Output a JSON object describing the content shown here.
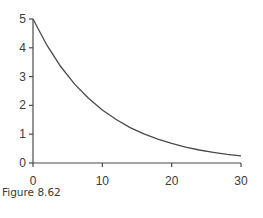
{
  "caption": "Figure 8.62",
  "chart_data": {
    "type": "line",
    "title": "",
    "xlabel": "",
    "ylabel": "",
    "xlim": [
      0,
      30
    ],
    "ylim": [
      0,
      5
    ],
    "xticks": [
      0,
      10,
      20,
      30
    ],
    "yticks": [
      0,
      1,
      2,
      3,
      4,
      5
    ],
    "grid": false,
    "legend": null,
    "series": [
      {
        "name": "curve",
        "x": [
          0,
          2,
          4,
          6,
          8,
          10,
          12,
          14,
          16,
          18,
          20,
          22,
          24,
          26,
          28,
          30
        ],
        "y": [
          5.0,
          4.09,
          3.35,
          2.74,
          2.25,
          1.84,
          1.51,
          1.23,
          1.01,
          0.83,
          0.68,
          0.55,
          0.45,
          0.37,
          0.3,
          0.25
        ]
      }
    ],
    "colors": {
      "line": "#4a4a4a",
      "axis": "#4a4a4a"
    }
  }
}
